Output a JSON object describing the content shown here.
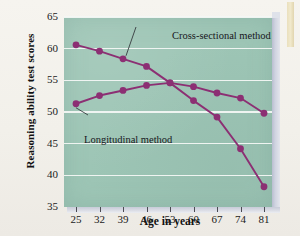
{
  "figure": {
    "background_color": "#f4f2ed",
    "plot_background_color": "#9dc5b5",
    "line_color": "#8c2f73",
    "gridline_color": "#f3f7f4",
    "edge_3d_color": "#c9cdda"
  },
  "chart_data": {
    "type": "line",
    "title": "",
    "xlabel": "Age in years",
    "ylabel": "Reasoning ability test scores",
    "categories": [
      25,
      32,
      39,
      46,
      53,
      60,
      67,
      74,
      81
    ],
    "x": [
      25,
      32,
      39,
      46,
      53,
      60,
      67,
      74,
      81
    ],
    "xtick_labels": [
      "25",
      "32",
      "39",
      "46",
      "53",
      "60",
      "67",
      "74",
      "81"
    ],
    "ytick_labels": [
      "65",
      "60",
      "55",
      "50",
      "45",
      "40",
      "35"
    ],
    "yticks": [
      65,
      60,
      55,
      50,
      45,
      40,
      35
    ],
    "ylim": [
      35,
      65
    ],
    "xlim": [
      25,
      81
    ],
    "grid": true,
    "grid_axis": "y",
    "legend": "inline-annotations",
    "series": [
      {
        "name": "Cross-sectional method",
        "color": "#8c2f73",
        "marker": "circle",
        "values": [
          60.6,
          59.6,
          58.4,
          57.2,
          54.6,
          51.8,
          49.2,
          44.2,
          38.2
        ]
      },
      {
        "name": "Longitudinal method",
        "color": "#8c2f73",
        "marker": "circle",
        "values": [
          51.3,
          52.6,
          53.4,
          54.2,
          54.6,
          54.0,
          53.0,
          52.2,
          49.8
        ]
      }
    ],
    "annotations": [
      {
        "text": "Cross-sectional method",
        "points_to_series": "Cross-sectional method",
        "points_to_x": 39
      },
      {
        "text": "Longitudinal method",
        "points_to_series": "Longitudinal method",
        "points_to_x": 25
      }
    ]
  }
}
